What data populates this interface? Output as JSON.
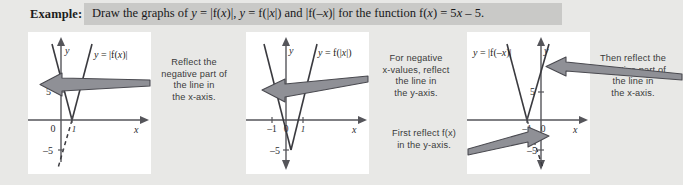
{
  "header": {
    "example_label": "Example:",
    "prompt_plain": "Draw the graphs of y = |f(x)|, y = f(|x|) and |f(–x)| for the function f(x) = 5x – 5.",
    "banner_color": "#c9c9c7"
  },
  "panels": [
    {
      "id": "panel-1",
      "curve_label": "y = |f(x)|",
      "axis_x_label": "x",
      "axis_y_label": "y",
      "tick_labels": [
        "0",
        "5",
        "–5",
        "1"
      ],
      "function": "f(x) = 5x - 5",
      "transform": "y = |f(x)|"
    },
    {
      "id": "panel-2",
      "curve_label": "y = f(|x|)",
      "axis_x_label": "x",
      "axis_y_label": "y",
      "tick_labels": [
        "0",
        "1",
        "–1",
        "–5"
      ],
      "function": "f(x) = 5x - 5",
      "transform": "y = f(|x|)"
    },
    {
      "id": "panel-3",
      "curve_label": "y = |f(–x)|",
      "axis_x_label": "x",
      "axis_y_label": "y",
      "tick_labels": [
        "0",
        "5",
        "–1",
        "–5"
      ],
      "function": "f(x) = 5x - 5",
      "transform": "y = |f(-x)|"
    }
  ],
  "notes": [
    {
      "id": "note-1",
      "text": "Reflect the\nnegative part of\nthe line in\nthe x-axis."
    },
    {
      "id": "note-2",
      "text": "For negative\nx-values, reflect\nthe line in\nthe y-axis."
    },
    {
      "id": "note-3",
      "text": "Then reflect the\nnegative part of\nthe line in\nthe x-axis."
    },
    {
      "id": "note-4",
      "text": "First reflect f(x)\nin the y-axis."
    }
  ],
  "colors": {
    "page_background": "#e8e8e6",
    "panel_background": "#ffffff",
    "axis": "#55555a",
    "curve": "#3a3a3f",
    "arrow_fill": "#8f9096",
    "arrow_stroke": "#4a4a50",
    "note_text": "#3a3a3a"
  }
}
